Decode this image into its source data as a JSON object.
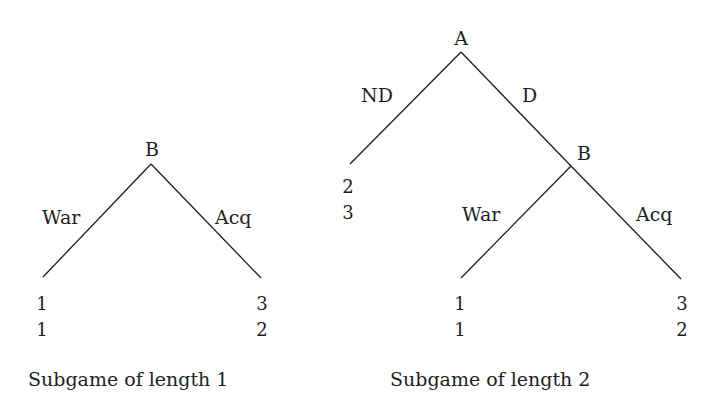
{
  "figure": {
    "left_tree": {
      "caption": "Subgame of length 1",
      "root": {
        "player": "B"
      },
      "branches": [
        {
          "label": "War",
          "payoffs": [
            "1",
            "1"
          ]
        },
        {
          "label": "Acq",
          "payoffs": [
            "3",
            "2"
          ]
        }
      ]
    },
    "right_tree": {
      "caption": "Subgame of length 2",
      "root": {
        "player": "A"
      },
      "root_branches": [
        {
          "label": "ND",
          "payoffs": [
            "2",
            "3"
          ]
        },
        {
          "label": "D",
          "to_node": "B"
        }
      ],
      "subnode": {
        "player": "B",
        "branches": [
          {
            "label": "War",
            "payoffs": [
              "1",
              "1"
            ]
          },
          {
            "label": "Acq",
            "payoffs": [
              "3",
              "2"
            ]
          }
        ]
      }
    },
    "line_color": "#1e1e1e"
  }
}
